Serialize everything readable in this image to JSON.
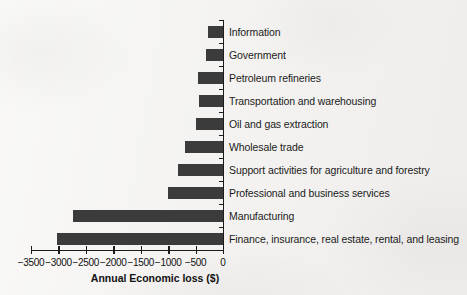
{
  "chart_data": {
    "type": "bar",
    "orientation": "horizontal",
    "title": "",
    "xlabel": "Annual Economic loss ($)",
    "ylabel": "",
    "xlim": [
      -3500,
      0
    ],
    "xticks": [
      -3500,
      -3000,
      -2500,
      -2000,
      -1500,
      -1000,
      -500,
      0
    ],
    "xtick_labels": [
      "−3500",
      "−3000",
      "−2500",
      "−2000",
      "−1500",
      "−1000",
      "−500",
      "0"
    ],
    "grid": false,
    "legend": null,
    "bar_color": "#3b3b3b",
    "background_color": "#f3f2f0",
    "axis_color": "#1b1b1b",
    "categories": [
      "Information",
      "Government",
      "Petroleum refineries",
      "Transportation and warehousing",
      "Oil and gas extraction",
      "Wholesale trade",
      "Support activities for agriculture and forestry",
      "Professional and business services",
      "Manufacturing",
      "Finance, insurance, real estate, rental, and leasing"
    ],
    "values": [
      -270,
      -310,
      -455,
      -440,
      -490,
      -690,
      -820,
      -1000,
      -2730,
      -3020
    ]
  }
}
